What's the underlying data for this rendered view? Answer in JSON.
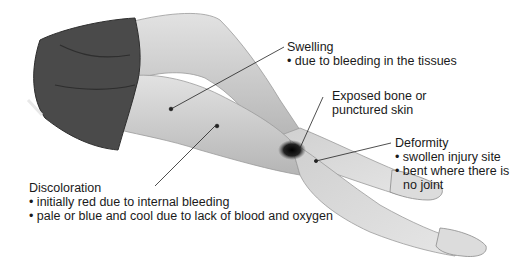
{
  "figure": {
    "labels": {
      "swelling": {
        "title": "Swelling",
        "bullets": [
          "due to bleeding in the tissues"
        ]
      },
      "exposed": {
        "title_line1": "Exposed bone or",
        "title_line2": "punctured skin"
      },
      "deformity": {
        "title": "Deformity",
        "bullets": [
          "swollen injury site",
          "bent where there is"
        ],
        "continuation": "no joint"
      },
      "discoloration": {
        "title": "Discoloration",
        "bullets": [
          "initially red due to internal bleeding",
          "pale or blue and cool due to lack of blood and oxygen"
        ]
      }
    },
    "colors": {
      "skin_light": "#d9d9d9",
      "skin_mid": "#b8b8b8",
      "skin_shadow": "#8f8f8f",
      "shorts": "#4a4a4a",
      "shorts_dark": "#2e2e2e",
      "wound": "#1a1a1a",
      "leader_line": "#222222",
      "text": "#1a1a1a"
    }
  }
}
